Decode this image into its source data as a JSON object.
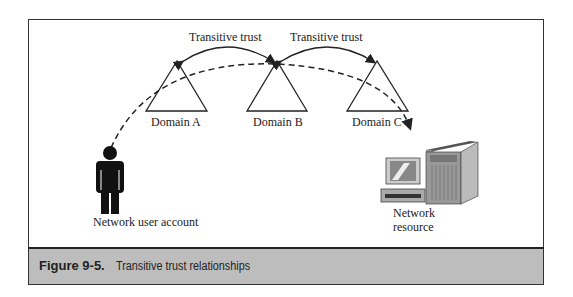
{
  "figure": {
    "caption_label": "Figure 9-5.",
    "caption_text": "Transitive trust relationships"
  },
  "diagram": {
    "trust_labels": [
      "Transitive trust",
      "Transitive trust"
    ],
    "domains": [
      {
        "label": "Domain A"
      },
      {
        "label": "Domain B"
      },
      {
        "label": "Domain C"
      }
    ],
    "user": {
      "label": "Network user account"
    },
    "resource": {
      "label_line1": "Network",
      "label_line2": "resource"
    }
  },
  "colors": {
    "caption_bg": "#bdbdbd",
    "line": "#222222"
  }
}
